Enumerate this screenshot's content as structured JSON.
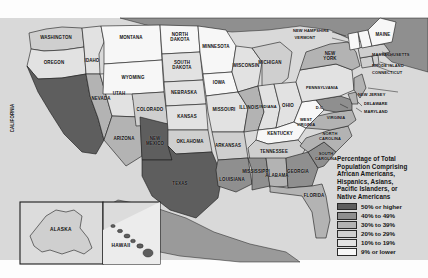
{
  "figure": {
    "background_color": "#fdfdfd",
    "ocean_color": "#d8d8d8",
    "foreign_land_color": "#8d8d8d",
    "border_color": "#1d1d1d"
  },
  "legend": {
    "title": "Percentage of Total\nPopulation Comprising\nAfrican Americans,\nHispanics, Asians,\nPacific Islanders, or\nNative Americans",
    "items": [
      {
        "label": "50% or higher",
        "color": "#5e5e5e"
      },
      {
        "label": "40% to 49%",
        "color": "#8f8f8f"
      },
      {
        "label": "30% to 39%",
        "color": "#b3b3b3"
      },
      {
        "label": "20% to 29%",
        "color": "#cfcfcf"
      },
      {
        "label": "10% to 19%",
        "color": "#e2e2e2"
      },
      {
        "label": "9% or lower",
        "color": "#f7f7f7"
      }
    ]
  },
  "chart_data": {
    "type": "map",
    "subtype": "choropleth",
    "title": "Percentage of Total Population Comprising African Americans, Hispanics, Asians, Pacific Islanders, or Native Americans",
    "units": "percent of total population",
    "bins": [
      {
        "label": "50% or higher",
        "color": "#5e5e5e",
        "min": 50,
        "max": 100
      },
      {
        "label": "40% to 49%",
        "color": "#8f8f8f",
        "min": 40,
        "max": 49
      },
      {
        "label": "30% to 39%",
        "color": "#b3b3b3",
        "min": 30,
        "max": 39
      },
      {
        "label": "20% to 29%",
        "color": "#cfcfcf",
        "min": 20,
        "max": 29
      },
      {
        "label": "10% to 19%",
        "color": "#e2e2e2",
        "min": 10,
        "max": 19
      },
      {
        "label": "9% or lower",
        "color": "#f7f7f7",
        "min": 0,
        "max": 9
      }
    ],
    "regions": [
      {
        "name": "WASHINGTON",
        "bin": "20% to 29%"
      },
      {
        "name": "OREGON",
        "bin": "10% to 19%"
      },
      {
        "name": "IDAHO",
        "bin": "10% to 19%"
      },
      {
        "name": "CALIFORNIA",
        "bin": "50% or higher"
      },
      {
        "name": "NEVADA",
        "bin": "30% to 39%"
      },
      {
        "name": "UTAH",
        "bin": "10% to 19%"
      },
      {
        "name": "ARIZONA",
        "bin": "30% to 39%"
      },
      {
        "name": "MONTANA",
        "bin": "9% or lower"
      },
      {
        "name": "WYOMING",
        "bin": "9% or lower"
      },
      {
        "name": "COLORADO",
        "bin": "20% to 29%"
      },
      {
        "name": "NEW MEXICO",
        "bin": "50% or higher"
      },
      {
        "name": "NORTH DAKOTA",
        "bin": "9% or lower"
      },
      {
        "name": "SOUTH DAKOTA",
        "bin": "10% to 19%"
      },
      {
        "name": "NEBRASKA",
        "bin": "10% to 19%"
      },
      {
        "name": "KANSAS",
        "bin": "10% to 19%"
      },
      {
        "name": "OKLAHOMA",
        "bin": "20% to 29%"
      },
      {
        "name": "TEXAS",
        "bin": "50% or higher"
      },
      {
        "name": "MINNESOTA",
        "bin": "9% or lower"
      },
      {
        "name": "IOWA",
        "bin": "9% or lower"
      },
      {
        "name": "MISSOURI",
        "bin": "10% to 19%"
      },
      {
        "name": "ARKANSAS",
        "bin": "20% to 29%"
      },
      {
        "name": "LOUISIANA",
        "bin": "40% to 49%"
      },
      {
        "name": "WISCONSIN",
        "bin": "10% to 19%"
      },
      {
        "name": "ILLINOIS",
        "bin": "30% to 39%"
      },
      {
        "name": "MICHIGAN",
        "bin": "20% to 29%"
      },
      {
        "name": "INDIANA",
        "bin": "10% to 19%"
      },
      {
        "name": "OHIO",
        "bin": "10% to 19%"
      },
      {
        "name": "KENTUCKY",
        "bin": "9% or lower"
      },
      {
        "name": "TENNESSEE",
        "bin": "20% to 29%"
      },
      {
        "name": "MISSISSIPPI",
        "bin": "40% to 49%"
      },
      {
        "name": "ALABAMA",
        "bin": "30% to 39%"
      },
      {
        "name": "GEORGIA",
        "bin": "40% to 49%"
      },
      {
        "name": "FLORIDA",
        "bin": "30% to 39%"
      },
      {
        "name": "SOUTH CAROLINA",
        "bin": "40% to 49%"
      },
      {
        "name": "NORTH CAROLINA",
        "bin": "30% to 39%"
      },
      {
        "name": "VIRGINIA",
        "bin": "30% to 39%"
      },
      {
        "name": "WEST VIRGINIA",
        "bin": "9% or lower"
      },
      {
        "name": "MARYLAND",
        "bin": "40% to 49%"
      },
      {
        "name": "DELAWARE",
        "bin": "30% to 39%"
      },
      {
        "name": "D.C.",
        "bin": "50% or higher"
      },
      {
        "name": "PENNSYLVANIA",
        "bin": "10% to 19%"
      },
      {
        "name": "NEW JERSEY",
        "bin": "30% to 39%"
      },
      {
        "name": "NEW YORK",
        "bin": "30% to 39%"
      },
      {
        "name": "CONNECTICUT",
        "bin": "20% to 29%"
      },
      {
        "name": "RHODE ISLAND",
        "bin": "20% to 29%"
      },
      {
        "name": "MASSACHUSETTS",
        "bin": "20% to 29%"
      },
      {
        "name": "VERMONT",
        "bin": "9% or lower"
      },
      {
        "name": "NEW HAMPSHIRE",
        "bin": "9% or lower"
      },
      {
        "name": "MAINE",
        "bin": "9% or lower"
      },
      {
        "name": "ALASKA",
        "bin": "20% to 29%"
      },
      {
        "name": "HAWAII",
        "bin": "50% or higher"
      }
    ]
  },
  "labels": {
    "washington": "WASHINGTON",
    "oregon": "OREGON",
    "idaho": "IDAHO",
    "california": "CALIFORNIA",
    "nevada": "NEVADA",
    "utah": "UTAH",
    "arizona": "ARIZONA",
    "montana": "MONTANA",
    "wyoming": "WYOMING",
    "colorado": "COLORADO",
    "new_mexico": "NEW\nMEXICO",
    "north_dakota": "NORTH\nDAKOTA",
    "south_dakota": "SOUTH\nDAKOTA",
    "nebraska": "NEBRASKA",
    "kansas": "KANSAS",
    "oklahoma": "OKLAHOMA",
    "texas": "TEXAS",
    "minnesota": "MINNESOTA",
    "iowa": "IOWA",
    "missouri": "MISSOURI",
    "arkansas": "ARKANSAS",
    "louisiana": "LOUISIANA",
    "wisconsin": "WISCONSIN",
    "illinois": "ILLINOIS",
    "michigan": "MICHIGAN",
    "indiana": "INDIANA",
    "ohio": "OHIO",
    "kentucky": "KENTUCKY",
    "tennessee": "TENNESSEE",
    "mississippi": "MISSISSIPPI",
    "alabama": "ALABAMA",
    "georgia": "GEORGIA",
    "florida": "FLORIDA",
    "south_carolina": "SOUTH\nCAROLINA",
    "north_carolina": "NORTH\nCAROLINA",
    "virginia": "VIRGINIA",
    "west_virginia": "WEST\nVIRGINIA",
    "maryland": "MARYLAND",
    "delaware": "DELAWARE",
    "dc": "D.C.",
    "pennsylvania": "PENNSYLVANIA",
    "new_jersey": "NEW JERSEY",
    "new_york": "NEW\nYORK",
    "connecticut": "CONNECTICUT",
    "rhode_island": "RHODE ISLAND",
    "massachusetts": "MASSACHUSETTS",
    "vermont": "VERMONT",
    "new_hampshire": "NEW HAMPSHIRE",
    "maine": "MAINE",
    "alaska": "ALASKA",
    "hawaii": "HAWAII"
  }
}
